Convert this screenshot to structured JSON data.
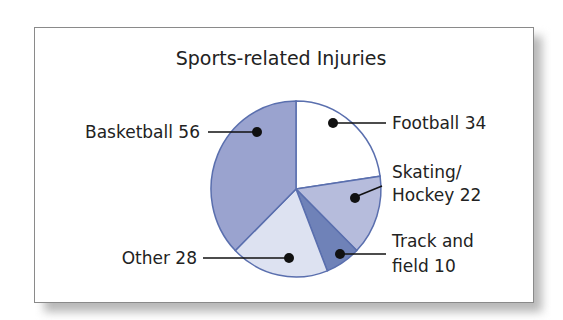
{
  "chart_data": {
    "type": "pie",
    "title": "Sports-related Injuries",
    "categories": [
      "Football",
      "Skating/ Hockey",
      "Track and field",
      "Other",
      "Basketball"
    ],
    "values": [
      34,
      22,
      10,
      28,
      56
    ],
    "colors": [
      "#ffffff",
      "#b6bcdc",
      "#6f82b8",
      "#dde2f1",
      "#9aa3cf"
    ],
    "start_angle": "top, clockwise"
  },
  "labels": {
    "football": "Football  34",
    "skating_1": "Skating/",
    "skating_2": "Hockey  22",
    "track_1": "Track and",
    "track_2": "field  10",
    "other": "Other  28",
    "basketball": "Basketball  56"
  }
}
